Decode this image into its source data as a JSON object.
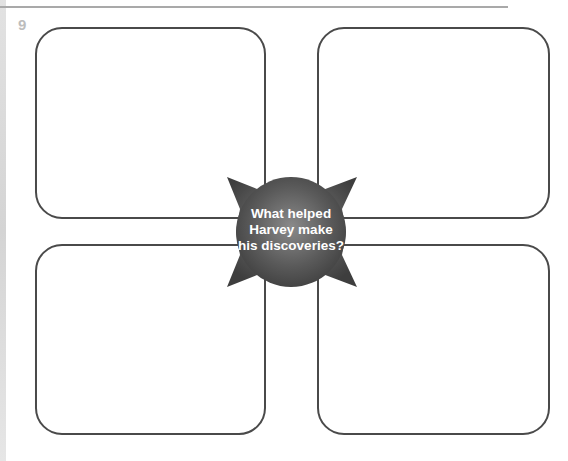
{
  "question_number": "9",
  "central_question": {
    "line1": "What helped",
    "line2": "Harvey make",
    "line3": "his discoveries?"
  },
  "answer_boxes": [
    {
      "position": "top-left",
      "content": ""
    },
    {
      "position": "top-right",
      "content": ""
    },
    {
      "position": "bottom-left",
      "content": ""
    },
    {
      "position": "bottom-right",
      "content": ""
    }
  ],
  "colors": {
    "box_border": "#4a4a4a",
    "star_fill": "#555555",
    "rule": "#a9a9a9",
    "question_number": "#bdbdbd"
  }
}
